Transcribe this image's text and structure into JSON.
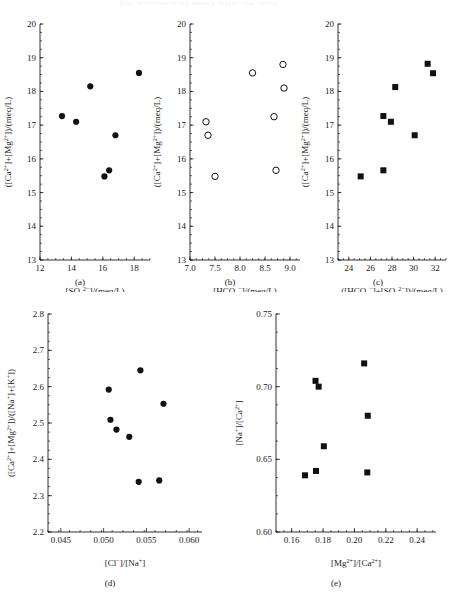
{
  "figure": {
    "background": "#ffffff",
    "marker_color": "#111111",
    "axis_color": "#1a1a1a",
    "faint_header_text": "Fig. Relationships among major ion ratios"
  },
  "captions": {
    "a": "(a)",
    "b": "(b)",
    "c": "(c)",
    "d": "(d)",
    "e": "(e)"
  },
  "chart_data": [
    {
      "panel": "a",
      "type": "scatter",
      "title": "",
      "marker": "filled-circle",
      "xlabel": "[SO₄²⁻]/(meq/L)",
      "ylabel": "([Ca²⁺]+[Mg²⁺])/(meq/L)",
      "xlim": [
        12,
        19
      ],
      "ylim": [
        13,
        20
      ],
      "xticks": [
        12,
        14,
        16,
        18
      ],
      "xtick_labels": [
        "12",
        "14",
        "16",
        "18"
      ],
      "yticks": [
        13,
        14,
        15,
        16,
        17,
        18,
        19,
        20
      ],
      "ytick_labels": [
        "13",
        "14",
        "15",
        "16",
        "17",
        "18",
        "19",
        "20"
      ],
      "x_minor_step": 0.5,
      "y_minor_step": 0.25,
      "grid": false,
      "legend": null,
      "points": [
        {
          "x": 13.4,
          "y": 17.27
        },
        {
          "x": 14.3,
          "y": 17.1
        },
        {
          "x": 15.2,
          "y": 18.15
        },
        {
          "x": 16.1,
          "y": 15.48
        },
        {
          "x": 16.4,
          "y": 15.66
        },
        {
          "x": 16.8,
          "y": 16.7
        },
        {
          "x": 18.3,
          "y": 18.55
        }
      ]
    },
    {
      "panel": "b",
      "type": "scatter",
      "title": "",
      "marker": "open-circle",
      "xlabel": "[HCO₃⁻]/(meq/L)",
      "ylabel": "([Ca²⁺]+[Mg²⁺])/(meq/L)",
      "xlim": [
        7.0,
        9.2
      ],
      "ylim": [
        13,
        20
      ],
      "xticks": [
        7.0,
        7.5,
        8.0,
        8.5,
        9.0
      ],
      "xtick_labels": [
        "7.0",
        "7.5",
        "8.0",
        "8.5",
        "9.0"
      ],
      "yticks": [
        13,
        14,
        15,
        16,
        17,
        18,
        19,
        20
      ],
      "ytick_labels": [
        "13",
        "14",
        "15",
        "16",
        "17",
        "18",
        "19",
        "20"
      ],
      "x_minor_step": 0.125,
      "y_minor_step": 0.25,
      "grid": false,
      "legend": null,
      "points": [
        {
          "x": 7.32,
          "y": 17.1
        },
        {
          "x": 7.36,
          "y": 16.7
        },
        {
          "x": 7.5,
          "y": 15.48
        },
        {
          "x": 8.25,
          "y": 18.55
        },
        {
          "x": 8.68,
          "y": 17.25
        },
        {
          "x": 8.72,
          "y": 15.66
        },
        {
          "x": 8.86,
          "y": 18.8
        },
        {
          "x": 8.88,
          "y": 18.1
        }
      ]
    },
    {
      "panel": "c",
      "type": "scatter",
      "title": "",
      "marker": "filled-square",
      "xlabel": "([HCO₃⁻]+[SO₄²⁻])/(meq/L)",
      "ylabel": "([Ca²⁺]+[Mg²⁺])/(meq/L)",
      "xlim": [
        23,
        33
      ],
      "ylim": [
        13,
        20
      ],
      "xticks": [
        24,
        26,
        28,
        30,
        32
      ],
      "xtick_labels": [
        "24",
        "26",
        "28",
        "30",
        "32"
      ],
      "yticks": [
        13,
        14,
        15,
        16,
        17,
        18,
        19,
        20
      ],
      "ytick_labels": [
        "13",
        "14",
        "15",
        "16",
        "17",
        "18",
        "19",
        "20"
      ],
      "x_minor_step": 0.5,
      "y_minor_step": 0.25,
      "grid": false,
      "legend": null,
      "points": [
        {
          "x": 25.1,
          "y": 15.48
        },
        {
          "x": 27.2,
          "y": 15.66
        },
        {
          "x": 27.2,
          "y": 17.27
        },
        {
          "x": 27.9,
          "y": 17.1
        },
        {
          "x": 28.3,
          "y": 18.13
        },
        {
          "x": 30.1,
          "y": 16.7
        },
        {
          "x": 31.3,
          "y": 18.82
        },
        {
          "x": 31.8,
          "y": 18.54
        }
      ]
    },
    {
      "panel": "d",
      "type": "scatter",
      "title": "",
      "marker": "filled-circle",
      "xlabel": "[Cl⁻]/[Na⁺]",
      "ylabel": "([Ca²⁺]+[Mg²⁺])/([Na⁺]+[K⁺])",
      "xlim": [
        0.0435,
        0.0615
      ],
      "ylim": [
        2.2,
        2.8
      ],
      "xticks": [
        0.045,
        0.05,
        0.055,
        0.06
      ],
      "xtick_labels": [
        "0.045",
        "0.050",
        "0.055",
        "0.060"
      ],
      "yticks": [
        2.2,
        2.3,
        2.4,
        2.5,
        2.6,
        2.7,
        2.8
      ],
      "ytick_labels": [
        "2.2",
        "2.3",
        "2.4",
        "2.5",
        "2.6",
        "2.7",
        "2.8"
      ],
      "x_minor_step": 0.00125,
      "y_minor_step": 0.025,
      "grid": false,
      "legend": null,
      "points": [
        {
          "x": 0.0506,
          "y": 2.592
        },
        {
          "x": 0.0508,
          "y": 2.509
        },
        {
          "x": 0.0515,
          "y": 2.482
        },
        {
          "x": 0.053,
          "y": 2.462
        },
        {
          "x": 0.0541,
          "y": 2.338
        },
        {
          "x": 0.0543,
          "y": 2.645
        },
        {
          "x": 0.0565,
          "y": 2.342
        },
        {
          "x": 0.057,
          "y": 2.553
        }
      ]
    },
    {
      "panel": "e",
      "type": "scatter",
      "title": "",
      "marker": "filled-square",
      "xlabel": "[Mg²⁺]/[Ca²⁺]",
      "ylabel": "[Na⁺]/[Ca²⁺]",
      "xlim": [
        0.15,
        0.252
      ],
      "ylim": [
        0.6,
        0.75
      ],
      "xticks": [
        0.16,
        0.18,
        0.2,
        0.22,
        0.24
      ],
      "xtick_labels": [
        "0.16",
        "0.18",
        "0.20",
        "0.22",
        "0.24"
      ],
      "yticks": [
        0.6,
        0.65,
        0.7,
        0.75
      ],
      "ytick_labels": [
        "0.60",
        "0.65",
        "0.70",
        "0.75"
      ],
      "x_minor_step": 0.005,
      "y_minor_step": 0.0125,
      "grid": false,
      "legend": null,
      "points": [
        {
          "x": 0.1685,
          "y": 0.639
        },
        {
          "x": 0.1755,
          "y": 0.642
        },
        {
          "x": 0.1752,
          "y": 0.704
        },
        {
          "x": 0.1772,
          "y": 0.7
        },
        {
          "x": 0.1805,
          "y": 0.659
        },
        {
          "x": 0.2062,
          "y": 0.716
        },
        {
          "x": 0.2085,
          "y": 0.68
        },
        {
          "x": 0.2082,
          "y": 0.641
        }
      ]
    }
  ]
}
